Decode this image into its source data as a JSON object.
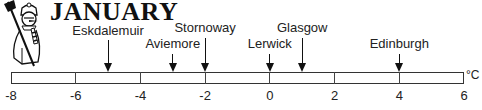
{
  "title": "JANUARY",
  "unit": "°C",
  "chart_data": {
    "type": "scatter",
    "title": "JANUARY",
    "xlabel": "°C",
    "ylabel": "",
    "xlim": [
      -8,
      6
    ],
    "ticks": [
      -8,
      -6,
      -4,
      -2,
      0,
      2,
      4,
      6
    ],
    "tick_labels": [
      "-8",
      "-6",
      "-4",
      "-2",
      "0",
      "2",
      "4",
      "6"
    ],
    "points": [
      {
        "label": "Eskdalemuir",
        "value": -5
      },
      {
        "label": "Aviemore",
        "value": -3
      },
      {
        "label": "Stornoway",
        "value": -2
      },
      {
        "label": "Lerwick",
        "value": 0
      },
      {
        "label": "Glasgow",
        "value": 1
      },
      {
        "label": "Edinburgh",
        "value": 4
      }
    ],
    "grid": false,
    "legend": "none"
  },
  "layout": {
    "bar_left": 11,
    "bar_right": 464,
    "points_layout": [
      {
        "label_top": 23,
        "arrow_top": 40
      },
      {
        "label_top": 36,
        "arrow_top": 54
      },
      {
        "label_top": 20,
        "arrow_top": 38
      },
      {
        "label_top": 36,
        "arrow_top": 54
      },
      {
        "label_top": 20,
        "arrow_top": 38
      },
      {
        "label_top": 36,
        "arrow_top": 54
      }
    ]
  }
}
